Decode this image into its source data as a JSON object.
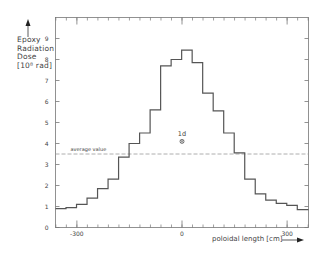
{
  "chart_data": {
    "type": "bar",
    "style": "step-histogram",
    "title": "",
    "ylabel": [
      "Epoxy",
      "Radiation",
      "Dose",
      "[10⁸ rad]"
    ],
    "xlabel": "poloidal length [cm]",
    "xlim": [
      -361,
      361
    ],
    "ylim": [
      0,
      9.3
    ],
    "x_ticks": [
      -300,
      0,
      300
    ],
    "y_ticks": [
      0,
      1,
      2,
      3,
      4,
      5,
      6,
      7,
      8,
      9
    ],
    "bin_width_cm": 30,
    "bin_edges": [
      -361,
      -331,
      -301,
      -271,
      -241,
      -211,
      -181,
      -151,
      -121,
      -91,
      -61,
      -31,
      -1,
      29,
      59,
      89,
      119,
      149,
      179,
      209,
      239,
      269,
      299,
      329,
      361
    ],
    "values": [
      0.9,
      0.95,
      1.1,
      1.4,
      1.85,
      2.3,
      3.35,
      4.0,
      4.5,
      5.6,
      7.7,
      8.0,
      8.45,
      7.85,
      6.4,
      5.55,
      4.5,
      3.55,
      2.3,
      1.6,
      1.3,
      1.15,
      1.05,
      0.85
    ],
    "reference_line": {
      "label": "average value",
      "y": 3.5,
      "style": "dashed"
    },
    "annotations": [
      {
        "label": "1d",
        "x": 0,
        "y": 4.1,
        "marker": "circled-x"
      }
    ],
    "grid": false,
    "legend": null
  },
  "labels": {
    "y_axis": [
      "Epoxy",
      "Radiation",
      "Dose",
      "[10⁸ rad]"
    ],
    "x_axis": "poloidal length [cm]",
    "average": "average value",
    "point": "1d"
  },
  "colors": {
    "line": "#555555",
    "axis": "#777777",
    "text": "#444444",
    "average": "#999999"
  }
}
